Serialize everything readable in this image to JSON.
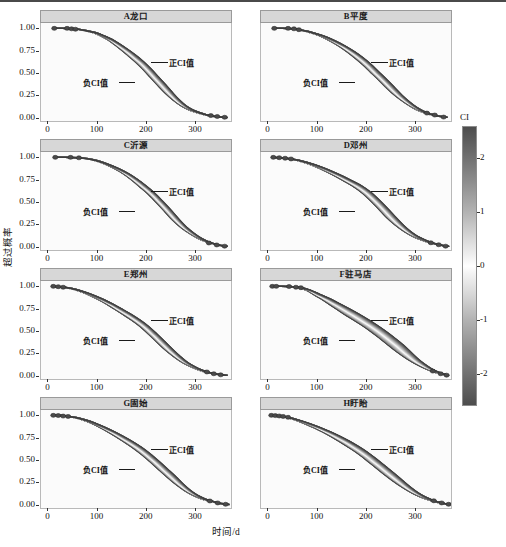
{
  "figure": {
    "xlabel": "时间/d",
    "ylabel": "超过概率"
  },
  "axes": {
    "ytick_labels": [
      "1.00",
      "0.75",
      "0.50",
      "0.25",
      "0.00"
    ],
    "ytick_values": [
      1.0,
      0.75,
      0.5,
      0.25,
      0.0
    ],
    "xtick_labels": [
      "0",
      "100",
      "200",
      "300"
    ],
    "xtick_values": [
      0,
      100,
      200,
      300
    ],
    "xlim": [
      -15,
      375
    ],
    "ylim": [
      -0.05,
      1.06
    ]
  },
  "annotations": {
    "positive": "正CI值",
    "negative": "负CI值"
  },
  "colorbar": {
    "title": "CI",
    "tick_labels": [
      "2",
      "1",
      "0",
      "-1",
      "-2"
    ],
    "tick_values": [
      2,
      1,
      0,
      -1,
      -2
    ],
    "vmin": -2.6,
    "vmax": 2.6,
    "colormap": "grey-white-grey",
    "low_color": "#4d4d4d",
    "mid_color": "#ffffff",
    "high_color": "#4d4d4d"
  },
  "chart_data": {
    "type": "line",
    "title": "",
    "xlabel": "时间/d",
    "ylabel": "超过概率",
    "xlim": [
      -15,
      375
    ],
    "ylim": [
      -0.05,
      1.06
    ],
    "grid": false,
    "legend": "colorbar-right",
    "panels": [
      {
        "key": "A",
        "label": "A龙口",
        "row": 0,
        "col": 0,
        "band_halfwidth_days": 9,
        "median": {
          "x": [
            10,
            30,
            45,
            60,
            75,
            95,
            110,
            125,
            140,
            155,
            170,
            185,
            200,
            215,
            230,
            245,
            260,
            275,
            290,
            305,
            320,
            335,
            350,
            362
          ],
          "y": [
            1.0,
            1.0,
            0.995,
            0.99,
            0.975,
            0.95,
            0.915,
            0.875,
            0.82,
            0.76,
            0.695,
            0.625,
            0.545,
            0.455,
            0.365,
            0.275,
            0.195,
            0.13,
            0.085,
            0.055,
            0.03,
            0.015,
            0.005,
            0.0
          ]
        },
        "markers": [
          {
            "x": 12,
            "y": 1.0
          },
          {
            "x": 38,
            "y": 1.0
          },
          {
            "x": 47,
            "y": 0.995
          },
          {
            "x": 55,
            "y": 0.99
          },
          {
            "x": 330,
            "y": 0.022
          },
          {
            "x": 343,
            "y": 0.012
          },
          {
            "x": 358,
            "y": 0.003
          }
        ]
      },
      {
        "key": "B",
        "label": "B平度",
        "row": 0,
        "col": 1,
        "band_halfwidth_days": 9,
        "median": {
          "x": [
            10,
            30,
            48,
            62,
            80,
            98,
            115,
            132,
            150,
            168,
            185,
            200,
            215,
            232,
            248,
            265,
            282,
            298,
            312,
            326,
            340,
            352,
            362
          ],
          "y": [
            1.0,
            1.0,
            0.995,
            0.985,
            0.965,
            0.935,
            0.9,
            0.855,
            0.8,
            0.735,
            0.665,
            0.595,
            0.515,
            0.425,
            0.335,
            0.245,
            0.17,
            0.11,
            0.07,
            0.042,
            0.022,
            0.01,
            0.002
          ]
        },
        "markers": [
          {
            "x": 12,
            "y": 1.0
          },
          {
            "x": 40,
            "y": 1.0
          },
          {
            "x": 52,
            "y": 0.995
          },
          {
            "x": 62,
            "y": 0.985
          },
          {
            "x": 322,
            "y": 0.05
          },
          {
            "x": 338,
            "y": 0.028
          },
          {
            "x": 356,
            "y": 0.005
          }
        ]
      },
      {
        "key": "C",
        "label": "C沂源",
        "row": 1,
        "col": 0,
        "band_halfwidth_days": 8,
        "median": {
          "x": [
            12,
            35,
            58,
            72,
            88,
            105,
            122,
            140,
            158,
            175,
            192,
            208,
            225,
            242,
            258,
            275,
            292,
            308,
            322,
            336,
            350,
            362
          ],
          "y": [
            1.0,
            1.0,
            0.995,
            0.99,
            0.975,
            0.95,
            0.915,
            0.87,
            0.815,
            0.75,
            0.675,
            0.6,
            0.505,
            0.405,
            0.305,
            0.215,
            0.145,
            0.09,
            0.055,
            0.03,
            0.012,
            0.002
          ]
        },
        "markers": [
          {
            "x": 14,
            "y": 1.0
          },
          {
            "x": 45,
            "y": 1.0
          },
          {
            "x": 62,
            "y": 0.995
          },
          {
            "x": 326,
            "y": 0.04
          },
          {
            "x": 342,
            "y": 0.018
          },
          {
            "x": 358,
            "y": 0.004
          }
        ]
      },
      {
        "key": "D",
        "label": "D邓州",
        "row": 1,
        "col": 1,
        "band_halfwidth_days": 10,
        "median": {
          "x": [
            8,
            25,
            42,
            58,
            75,
            92,
            110,
            128,
            145,
            162,
            180,
            198,
            215,
            232,
            248,
            265,
            282,
            298,
            314,
            328,
            342,
            355,
            365
          ],
          "y": [
            1.0,
            0.995,
            0.985,
            0.97,
            0.945,
            0.915,
            0.875,
            0.83,
            0.785,
            0.735,
            0.68,
            0.61,
            0.525,
            0.43,
            0.335,
            0.245,
            0.17,
            0.115,
            0.075,
            0.045,
            0.025,
            0.01,
            0.002
          ]
        },
        "markers": [
          {
            "x": 10,
            "y": 1.0
          },
          {
            "x": 22,
            "y": 0.996
          },
          {
            "x": 34,
            "y": 0.99
          },
          {
            "x": 46,
            "y": 0.982
          },
          {
            "x": 330,
            "y": 0.042
          },
          {
            "x": 346,
            "y": 0.02
          },
          {
            "x": 360,
            "y": 0.004
          }
        ]
      },
      {
        "key": "E",
        "label": "E郑州",
        "row": 2,
        "col": 0,
        "band_halfwidth_days": 9,
        "median": {
          "x": [
            8,
            22,
            38,
            55,
            72,
            90,
            108,
            125,
            142,
            160,
            178,
            195,
            212,
            228,
            245,
            262,
            278,
            295,
            310,
            325,
            340,
            352,
            362
          ],
          "y": [
            1.0,
            0.995,
            0.985,
            0.965,
            0.935,
            0.895,
            0.85,
            0.8,
            0.745,
            0.685,
            0.62,
            0.55,
            0.465,
            0.38,
            0.29,
            0.21,
            0.145,
            0.095,
            0.06,
            0.035,
            0.018,
            0.008,
            0.002
          ]
        },
        "markers": [
          {
            "x": 10,
            "y": 1.0
          },
          {
            "x": 20,
            "y": 0.996
          },
          {
            "x": 30,
            "y": 0.99
          },
          {
            "x": 322,
            "y": 0.04
          },
          {
            "x": 336,
            "y": 0.02
          },
          {
            "x": 350,
            "y": 0.008
          }
        ]
      },
      {
        "key": "F",
        "label": "F驻马店",
        "row": 2,
        "col": 1,
        "band_halfwidth_days": 16,
        "median": {
          "x": [
            10,
            28,
            48,
            65,
            82,
            100,
            118,
            135,
            152,
            170,
            188,
            205,
            222,
            240,
            258,
            275,
            292,
            308,
            324,
            338,
            352,
            364
          ],
          "y": [
            1.0,
            1.0,
            0.995,
            0.985,
            0.955,
            0.905,
            0.855,
            0.8,
            0.745,
            0.685,
            0.625,
            0.565,
            0.5,
            0.425,
            0.345,
            0.265,
            0.19,
            0.13,
            0.08,
            0.045,
            0.02,
            0.003
          ]
        },
        "markers": [
          {
            "x": 8,
            "y": 1.0
          },
          {
            "x": 16,
            "y": 1.0
          },
          {
            "x": 42,
            "y": 0.998
          },
          {
            "x": 56,
            "y": 0.99
          },
          {
            "x": 66,
            "y": 0.985
          },
          {
            "x": 334,
            "y": 0.05
          },
          {
            "x": 350,
            "y": 0.02
          },
          {
            "x": 362,
            "y": 0.004
          }
        ]
      },
      {
        "key": "G",
        "label": "G固始",
        "row": 3,
        "col": 0,
        "band_halfwidth_days": 10,
        "median": {
          "x": [
            8,
            22,
            38,
            55,
            72,
            90,
            108,
            126,
            144,
            162,
            180,
            198,
            215,
            232,
            250,
            266,
            282,
            298,
            314,
            330,
            344,
            356,
            366
          ],
          "y": [
            1.0,
            0.998,
            0.99,
            0.975,
            0.95,
            0.915,
            0.87,
            0.82,
            0.765,
            0.705,
            0.64,
            0.565,
            0.485,
            0.4,
            0.31,
            0.23,
            0.16,
            0.105,
            0.065,
            0.038,
            0.018,
            0.007,
            0.001
          ]
        },
        "markers": [
          {
            "x": 10,
            "y": 1.0
          },
          {
            "x": 20,
            "y": 0.998
          },
          {
            "x": 30,
            "y": 0.992
          },
          {
            "x": 40,
            "y": 0.988
          },
          {
            "x": 328,
            "y": 0.04
          },
          {
            "x": 344,
            "y": 0.018
          },
          {
            "x": 360,
            "y": 0.003
          }
        ]
      },
      {
        "key": "H",
        "label": "H盱眙",
        "row": 3,
        "col": 1,
        "band_halfwidth_days": 12,
        "median": {
          "x": [
            6,
            18,
            32,
            48,
            65,
            82,
            100,
            118,
            136,
            154,
            172,
            190,
            208,
            226,
            244,
            262,
            280,
            298,
            314,
            330,
            345,
            358,
            368
          ],
          "y": [
            1.0,
            0.995,
            0.985,
            0.965,
            0.935,
            0.9,
            0.86,
            0.815,
            0.765,
            0.71,
            0.65,
            0.585,
            0.51,
            0.43,
            0.35,
            0.27,
            0.195,
            0.13,
            0.085,
            0.05,
            0.025,
            0.01,
            0.002
          ]
        },
        "markers": [
          {
            "x": 6,
            "y": 1.0
          },
          {
            "x": 14,
            "y": 0.997
          },
          {
            "x": 22,
            "y": 0.993
          },
          {
            "x": 30,
            "y": 0.988
          },
          {
            "x": 40,
            "y": 0.978
          },
          {
            "x": 336,
            "y": 0.042
          },
          {
            "x": 352,
            "y": 0.018
          },
          {
            "x": 366,
            "y": 0.003
          }
        ]
      }
    ]
  }
}
